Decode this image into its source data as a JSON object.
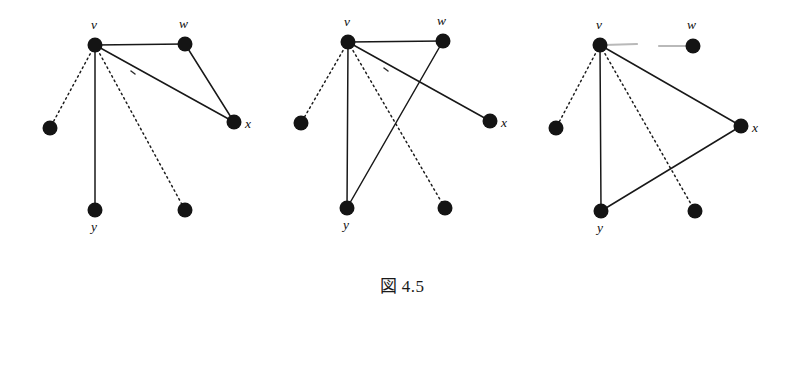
{
  "figure": {
    "caption": "図 4.5",
    "background_color": "#ffffff",
    "ink_color": "#141414",
    "ghost_color": "#b9b9b9",
    "width": 804,
    "height": 389
  },
  "diagrams": [
    {
      "id": "panel-1",
      "name": "stage-one",
      "nodes": [
        {
          "id": "v",
          "label": "v",
          "cx": 95,
          "cy": 45,
          "r": 7.5,
          "label_x": 91,
          "label_y": 29
        },
        {
          "id": "w",
          "label": "w",
          "cx": 185,
          "cy": 44,
          "r": 7.5,
          "label_x": 179,
          "label_y": 28
        },
        {
          "id": "x",
          "label": "x",
          "cx": 234,
          "cy": 122,
          "r": 7.5,
          "label_x": 245,
          "label_y": 128
        },
        {
          "id": "y",
          "label": "y",
          "cx": 95,
          "cy": 210,
          "r": 7.5,
          "label_x": 91,
          "label_y": 231
        },
        {
          "id": "a",
          "label": "",
          "cx": 50,
          "cy": 128,
          "r": 7.5,
          "label_x": 0,
          "label_y": 0
        },
        {
          "id": "b",
          "label": "",
          "cx": 185,
          "cy": 210,
          "r": 7.5,
          "label_x": 0,
          "label_y": 0
        }
      ],
      "edges": [
        {
          "from": "v",
          "to": "w",
          "style": "solid"
        },
        {
          "from": "v",
          "to": "x",
          "style": "solid"
        },
        {
          "from": "w",
          "to": "x",
          "style": "solid"
        },
        {
          "from": "v",
          "to": "y",
          "style": "solid"
        },
        {
          "from": "v",
          "to": "a",
          "style": "dotted"
        },
        {
          "from": "v",
          "to": "b",
          "style": "dotted"
        }
      ],
      "ticks": [
        {
          "x1": 131,
          "y1": 71,
          "x2": 135,
          "y2": 74
        }
      ],
      "ghost_edges": []
    },
    {
      "id": "panel-2",
      "name": "stage-two",
      "nodes": [
        {
          "id": "v",
          "label": "v",
          "cx": 348,
          "cy": 42,
          "r": 7.5,
          "label_x": 344,
          "label_y": 26
        },
        {
          "id": "w",
          "label": "w",
          "cx": 443,
          "cy": 41,
          "r": 7.5,
          "label_x": 437,
          "label_y": 25
        },
        {
          "id": "x",
          "label": "x",
          "cx": 490,
          "cy": 121,
          "r": 7.5,
          "label_x": 501,
          "label_y": 127
        },
        {
          "id": "y",
          "label": "y",
          "cx": 347,
          "cy": 208,
          "r": 7.5,
          "label_x": 343,
          "label_y": 229
        },
        {
          "id": "a",
          "label": "",
          "cx": 301,
          "cy": 123,
          "r": 7.5,
          "label_x": 0,
          "label_y": 0
        },
        {
          "id": "b",
          "label": "",
          "cx": 445,
          "cy": 208,
          "r": 7.5,
          "label_x": 0,
          "label_y": 0
        }
      ],
      "edges": [
        {
          "from": "v",
          "to": "w",
          "style": "solid"
        },
        {
          "from": "v",
          "to": "x",
          "style": "solid"
        },
        {
          "from": "w",
          "to": "y",
          "style": "solid"
        },
        {
          "from": "v",
          "to": "y",
          "style": "solid"
        },
        {
          "from": "v",
          "to": "a",
          "style": "dotted"
        },
        {
          "from": "v",
          "to": "b",
          "style": "dotted"
        }
      ],
      "ticks": [
        {
          "x1": 384,
          "y1": 68,
          "x2": 388,
          "y2": 71
        }
      ],
      "ghost_edges": []
    },
    {
      "id": "panel-3",
      "name": "stage-three",
      "nodes": [
        {
          "id": "v",
          "label": "v",
          "cx": 600,
          "cy": 45,
          "r": 7.5,
          "label_x": 596,
          "label_y": 29
        },
        {
          "id": "w",
          "label": "w",
          "cx": 693,
          "cy": 46,
          "r": 7.5,
          "label_x": 687,
          "label_y": 29
        },
        {
          "id": "x",
          "label": "x",
          "cx": 741,
          "cy": 126,
          "r": 7.5,
          "label_x": 752,
          "label_y": 132
        },
        {
          "id": "y",
          "label": "y",
          "cx": 601,
          "cy": 211,
          "r": 7.5,
          "label_x": 597,
          "label_y": 232
        },
        {
          "id": "a",
          "label": "",
          "cx": 556,
          "cy": 128,
          "r": 7.5,
          "label_x": 0,
          "label_y": 0
        },
        {
          "id": "b",
          "label": "",
          "cx": 695,
          "cy": 211,
          "r": 7.5,
          "label_x": 0,
          "label_y": 0
        }
      ],
      "edges": [
        {
          "from": "v",
          "to": "x",
          "style": "solid"
        },
        {
          "from": "x",
          "to": "y",
          "style": "solid"
        },
        {
          "from": "v",
          "to": "y",
          "style": "solid"
        },
        {
          "from": "v",
          "to": "a",
          "style": "dotted"
        },
        {
          "from": "v",
          "to": "b",
          "style": "dotted"
        }
      ],
      "ticks": [],
      "ghost_edges": [
        {
          "x1": 604,
          "y1": 45,
          "x2": 637,
          "y2": 44
        },
        {
          "x1": 659,
          "y1": 46,
          "x2": 690,
          "y2": 46
        }
      ]
    }
  ]
}
